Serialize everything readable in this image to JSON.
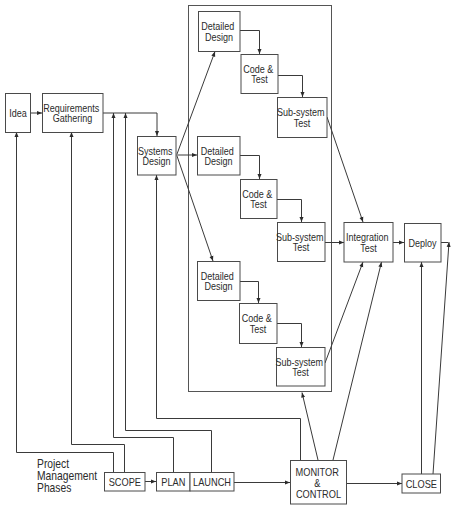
{
  "colors": {
    "line": "#3a3a3a",
    "box_border": "#4a4a4a",
    "text": "#2b2b2b",
    "background": "#ffffff"
  },
  "nodes": {
    "idea": {
      "lines": [
        "Idea"
      ]
    },
    "requirements": {
      "lines": [
        "Requirements",
        "Gathering"
      ]
    },
    "systems_design": {
      "lines": [
        "Systems",
        "Design"
      ]
    },
    "detailed_design_1": {
      "lines": [
        "Detailed",
        "Design"
      ]
    },
    "code_test_1": {
      "lines": [
        "Code &",
        "Test"
      ]
    },
    "subsystem_test_1": {
      "lines": [
        "Sub-system",
        "Test"
      ]
    },
    "detailed_design_2": {
      "lines": [
        "Detailed",
        "Design"
      ]
    },
    "code_test_2": {
      "lines": [
        "Code &",
        "Test"
      ]
    },
    "subsystem_test_2": {
      "lines": [
        "Sub-system",
        "Test"
      ]
    },
    "detailed_design_3": {
      "lines": [
        "Detailed",
        "Design"
      ]
    },
    "code_test_3": {
      "lines": [
        "Code &",
        "Test"
      ]
    },
    "subsystem_test_3": {
      "lines": [
        "Sub-system",
        "Test"
      ]
    },
    "integration_test": {
      "lines": [
        "Integration",
        "Test"
      ]
    },
    "deploy": {
      "lines": [
        "Deploy"
      ]
    }
  },
  "phases": {
    "label": [
      "Project",
      "Management",
      "Phases"
    ],
    "scope": "SCOPE",
    "plan": "PLAN",
    "launch": "LAUNCH",
    "monitor_control": [
      "MONITOR",
      "&",
      "CONTROL"
    ],
    "close": "CLOSE"
  },
  "edges": [
    {
      "from": "idea",
      "to": "requirements"
    },
    {
      "from": "requirements",
      "to": "systems_design"
    },
    {
      "from": "systems_design",
      "to": "detailed_design_1"
    },
    {
      "from": "systems_design",
      "to": "detailed_design_2"
    },
    {
      "from": "systems_design",
      "to": "detailed_design_3"
    },
    {
      "from": "detailed_design_1",
      "to": "code_test_1"
    },
    {
      "from": "code_test_1",
      "to": "subsystem_test_1"
    },
    {
      "from": "detailed_design_2",
      "to": "code_test_2"
    },
    {
      "from": "code_test_2",
      "to": "subsystem_test_2"
    },
    {
      "from": "detailed_design_3",
      "to": "code_test_3"
    },
    {
      "from": "code_test_3",
      "to": "subsystem_test_3"
    },
    {
      "from": "subsystem_test_1",
      "to": "integration_test"
    },
    {
      "from": "subsystem_test_2",
      "to": "integration_test"
    },
    {
      "from": "subsystem_test_3",
      "to": "integration_test"
    },
    {
      "from": "integration_test",
      "to": "deploy"
    },
    {
      "from": "scope",
      "to": "idea"
    },
    {
      "from": "scope",
      "to": "requirements"
    },
    {
      "from": "scope",
      "to": "plan"
    },
    {
      "from": "plan",
      "to": "requirements-to-systems-design"
    },
    {
      "from": "launch",
      "to": "requirements-to-systems-design"
    },
    {
      "from": "plan",
      "to": "launch"
    },
    {
      "from": "launch",
      "to": "monitor_control"
    },
    {
      "from": "monitor_control",
      "to": "systems_design"
    },
    {
      "from": "monitor_control",
      "to": "development-container"
    },
    {
      "from": "monitor_control",
      "to": "integration_test"
    },
    {
      "from": "monitor_control",
      "to": "close"
    },
    {
      "from": "close",
      "to": "deploy"
    },
    {
      "from": "close",
      "to": "deploy-output"
    }
  ]
}
